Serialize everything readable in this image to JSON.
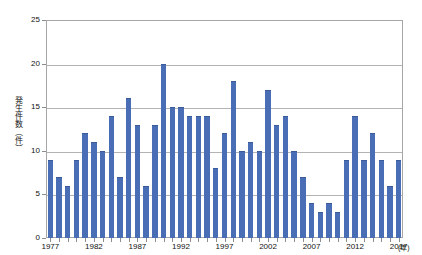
{
  "chart_data": {
    "type": "bar",
    "title": "",
    "xlabel": "(年)",
    "ylabel": "発生件数（件）",
    "ylim": [
      0,
      25
    ],
    "yticks": [
      0,
      5,
      10,
      15,
      20,
      25
    ],
    "ytick_labels": [
      "0",
      "5",
      "10",
      "15",
      "20",
      "25"
    ],
    "grid": true,
    "legend": "none",
    "xtick_labels": [
      "1977",
      "1982",
      "1987",
      "1992",
      "1997",
      "2002",
      "2007",
      "2012",
      "2017"
    ],
    "xtick_values": [
      1977,
      1982,
      1987,
      1992,
      1997,
      2002,
      2007,
      2012,
      2017
    ],
    "categories": [
      "1977",
      "1978",
      "1979",
      "1980",
      "1981",
      "1982",
      "1983",
      "1984",
      "1985",
      "1986",
      "1987",
      "1988",
      "1989",
      "1990",
      "1991",
      "1992",
      "1993",
      "1994",
      "1995",
      "1996",
      "1997",
      "1998",
      "1999",
      "2000",
      "2001",
      "2002",
      "2003",
      "2004",
      "2005",
      "2006",
      "2007",
      "2008",
      "2009",
      "2010",
      "2011",
      "2012",
      "2013",
      "2014",
      "2015",
      "2016",
      "2017"
    ],
    "values": [
      9,
      7,
      6,
      9,
      12,
      11,
      10,
      14,
      7,
      16,
      13,
      6,
      13,
      20,
      15,
      15,
      14,
      14,
      14,
      8,
      12,
      18,
      10,
      11,
      10,
      17,
      13,
      14,
      10,
      7,
      4,
      3,
      4,
      3,
      9,
      14,
      9,
      12,
      9,
      6,
      9
    ],
    "bar_color": "#4a6eb5",
    "gridline_color": "#b3b3b3",
    "frame_color": "#a6a6a6"
  }
}
